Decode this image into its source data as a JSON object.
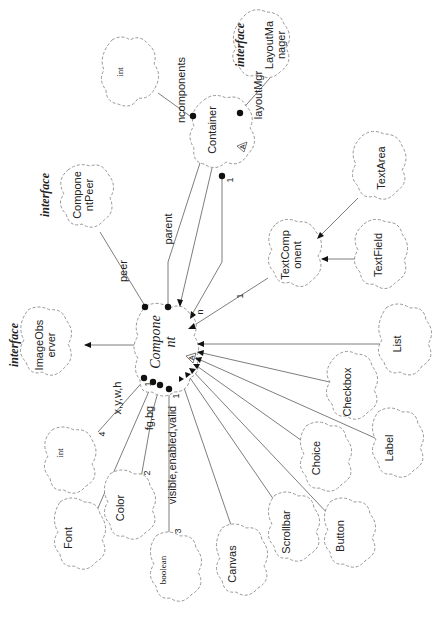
{
  "diagram": {
    "orientation": "rotated 90 degrees counter-clockwise",
    "central_class": {
      "id": "component",
      "name_line1": "Compone",
      "name_line2": "nt",
      "abstract_marker": "A"
    },
    "classes": [
      {
        "id": "int_top",
        "name_line1": "int",
        "name_line2": ""
      },
      {
        "id": "container",
        "name_line1": "Container",
        "name_line2": "",
        "abstract_marker": "A"
      },
      {
        "id": "layoutmanager",
        "name_line1": "LayoutMa",
        "name_line2": "nager",
        "stereotype": "interface"
      },
      {
        "id": "componentpeer",
        "name_line1": "Compone",
        "name_line2": "ntPeer",
        "stereotype": "interface"
      },
      {
        "id": "textarea",
        "name_line1": "TextArea",
        "name_line2": ""
      },
      {
        "id": "textcomponent",
        "name_line1": "TextComp",
        "name_line2": "onent"
      },
      {
        "id": "textfield",
        "name_line1": "TextField",
        "name_line2": ""
      },
      {
        "id": "imageobserver",
        "name_line1": "ImageObs",
        "name_line2": "erver",
        "stereotype": "interface"
      },
      {
        "id": "list",
        "name_line1": "List",
        "name_line2": ""
      },
      {
        "id": "checkbox",
        "name_line1": "Checkbox",
        "name_line2": ""
      },
      {
        "id": "label",
        "name_line1": "Label",
        "name_line2": ""
      },
      {
        "id": "int_bottom",
        "name_line1": "int",
        "name_line2": ""
      },
      {
        "id": "color",
        "name_line1": "Color",
        "name_line2": ""
      },
      {
        "id": "font",
        "name_line1": "Font",
        "name_line2": ""
      },
      {
        "id": "boolean",
        "name_line1": "boolean",
        "name_line2": ""
      },
      {
        "id": "canvas",
        "name_line1": "Canvas",
        "name_line2": ""
      },
      {
        "id": "scrollbar",
        "name_line1": "Scrollbar",
        "name_line2": ""
      },
      {
        "id": "choice",
        "name_line1": "Choice",
        "name_line2": ""
      },
      {
        "id": "button",
        "name_line1": "Button",
        "name_line2": ""
      }
    ],
    "stereotype_label": "interface",
    "relationships": [
      {
        "from": "container",
        "to": "int_top",
        "type": "has",
        "role": "ncomponents"
      },
      {
        "from": "container",
        "to": "layoutmanager",
        "type": "has",
        "role": "layoutMgr"
      },
      {
        "from": "container",
        "to": "component",
        "type": "has",
        "role": "",
        "multiplicity": "1",
        "target_multiplicity": "n"
      },
      {
        "from": "component",
        "to": "container",
        "type": "has",
        "role": "parent"
      },
      {
        "from": "container",
        "to": "component",
        "type": "inherits"
      },
      {
        "from": "component",
        "to": "componentpeer",
        "type": "has",
        "role": "peer"
      },
      {
        "from": "component",
        "to": "imageobserver",
        "type": "inherits"
      },
      {
        "from": "textarea",
        "to": "textcomponent",
        "type": "inherits"
      },
      {
        "from": "textfield",
        "to": "textcomponent",
        "type": "inherits"
      },
      {
        "from": "textcomponent",
        "to": "component",
        "type": "inherits"
      },
      {
        "from": "list",
        "to": "component",
        "type": "inherits"
      },
      {
        "from": "checkbox",
        "to": "component",
        "type": "inherits"
      },
      {
        "from": "label",
        "to": "component",
        "type": "inherits"
      },
      {
        "from": "choice",
        "to": "component",
        "type": "inherits"
      },
      {
        "from": "button",
        "to": "component",
        "type": "inherits"
      },
      {
        "from": "scrollbar",
        "to": "component",
        "type": "inherits"
      },
      {
        "from": "canvas",
        "to": "component",
        "type": "inherits"
      },
      {
        "from": "component",
        "to": "int_bottom",
        "type": "has",
        "role": "x,y,w,h",
        "multiplicity": "4",
        "source_multiplicity": "1"
      },
      {
        "from": "component",
        "to": "font",
        "type": "has",
        "role": "",
        "source_multiplicity": "1"
      },
      {
        "from": "component",
        "to": "color",
        "type": "has",
        "role": "fg,bg",
        "multiplicity": "2",
        "source_multiplicity": "1"
      },
      {
        "from": "component",
        "to": "boolean",
        "type": "has",
        "role": "visible,enabled,valid",
        "multiplicity": "3",
        "source_multiplicity": "1"
      }
    ],
    "labels": {
      "ncomponents": "ncomponents",
      "layoutMgr": "layoutMgr",
      "parent": "parent",
      "peer": "peer",
      "n": "n",
      "one": "1",
      "xywh": "x,y,w,h",
      "four": "4",
      "fgbg": "fg,bg",
      "two": "2",
      "vev": "visible,enabled,valid",
      "three": "3"
    }
  }
}
